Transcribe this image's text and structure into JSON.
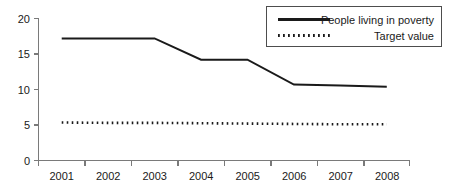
{
  "chart_data": {
    "type": "line",
    "title": "",
    "xlabel": "",
    "ylabel": "",
    "categories": [
      "2001",
      "2002",
      "2003",
      "2004",
      "2005",
      "2006",
      "2007",
      "2008"
    ],
    "series": [
      {
        "name": "People living in poverty",
        "style": "solid",
        "values": [
          17.2,
          17.2,
          17.2,
          14.2,
          14.2,
          10.7,
          10.55,
          10.4
        ]
      },
      {
        "name": "Target value",
        "style": "dotted",
        "values": [
          5.35,
          5.3,
          5.3,
          5.25,
          5.2,
          5.15,
          5.1,
          5.1
        ]
      }
    ],
    "ylim": [
      0,
      20
    ],
    "yticks": [
      0,
      5,
      10,
      15,
      20
    ],
    "ytick_labels": [
      "0",
      "5",
      "10",
      "15",
      "20"
    ],
    "grid": false,
    "legend_position": "top-right"
  },
  "legend": {
    "entries": [
      {
        "label": "People living in poverty",
        "style": "solid"
      },
      {
        "label": "Target value",
        "style": "dotted"
      }
    ]
  },
  "axes": {
    "y_tick_labels": [
      "20",
      "15",
      "10",
      "5",
      "0"
    ],
    "x_tick_labels": [
      "2001",
      "2002",
      "2003",
      "2004",
      "2005",
      "2006",
      "2007",
      "2008"
    ]
  },
  "colors": {
    "series_line": "#1a1a1a",
    "axis": "#7a7a7a",
    "legend_border": "#4d4d4d",
    "background": "#ffffff",
    "text": "#1a1a1a"
  }
}
